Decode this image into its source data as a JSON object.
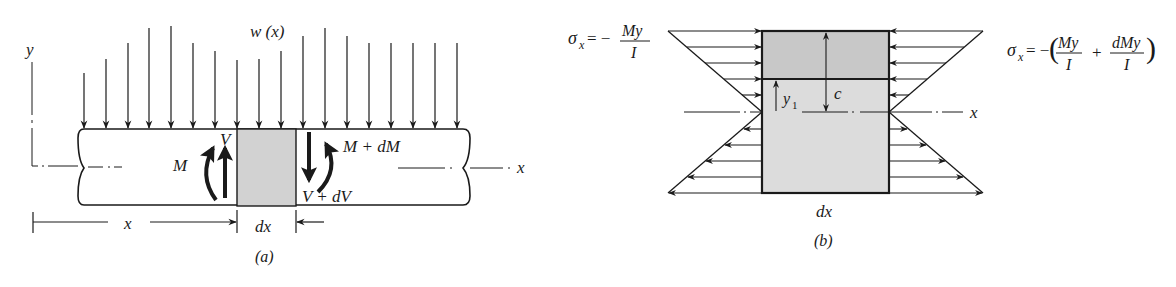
{
  "figure_a": {
    "caption": "(a)",
    "load_label": "w (x)",
    "y_axis_label": "y",
    "x_axis_label": "x",
    "moment_left": "M",
    "shear_left": "V",
    "moment_right": "M + dM",
    "shear_right": "V + dV",
    "dim_x_label": "x",
    "dim_dx_label": "dx",
    "load_arrows": [
      {
        "x": 84,
        "top": 73
      },
      {
        "x": 106,
        "top": 59
      },
      {
        "x": 128,
        "top": 43
      },
      {
        "x": 149,
        "top": 28
      },
      {
        "x": 171,
        "top": 26
      },
      {
        "x": 193,
        "top": 43
      },
      {
        "x": 215,
        "top": 51
      },
      {
        "x": 237,
        "top": 60
      },
      {
        "x": 259,
        "top": 59
      },
      {
        "x": 281,
        "top": 51
      },
      {
        "x": 303,
        "top": 36
      },
      {
        "x": 325,
        "top": 28
      },
      {
        "x": 347,
        "top": 36
      },
      {
        "x": 369,
        "top": 43
      },
      {
        "x": 391,
        "top": 43
      },
      {
        "x": 413,
        "top": 43
      },
      {
        "x": 435,
        "top": 43
      },
      {
        "x": 457,
        "top": 43
      }
    ]
  },
  "figure_b": {
    "caption": "(b)",
    "stress_left": {
      "lhs": "σ",
      "sub": "x",
      "eq": "= −",
      "num": "My",
      "den": "I"
    },
    "stress_right": {
      "lhs": "σ",
      "sub": "x",
      "eq": "= −",
      "num1": "My",
      "den1": "I",
      "plus": "+",
      "num2": "dMy",
      "den2": "I"
    },
    "x_axis_label": "x",
    "dim_c_label": "c",
    "dim_y1_label": "y",
    "dim_y1_sub": "1",
    "dim_dx_label": "dx",
    "colors": {
      "top_region": "#c8c8c8",
      "bottom_region": "#dcdcdc",
      "beam_element": "#d2d2d2",
      "line": "#1a1a1a"
    }
  }
}
